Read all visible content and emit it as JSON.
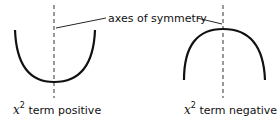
{
  "figure": {
    "annotation": "axes of symmetry",
    "left_panel": {
      "variable": "x",
      "exponent": "2",
      "caption": "term positive",
      "curve": "upward-opening parabola"
    },
    "right_panel": {
      "variable": "x",
      "exponent": "2",
      "caption": "term negative",
      "curve": "downward-opening parabola"
    },
    "colors": {
      "line": "#111111",
      "background": "#ffffff"
    }
  }
}
